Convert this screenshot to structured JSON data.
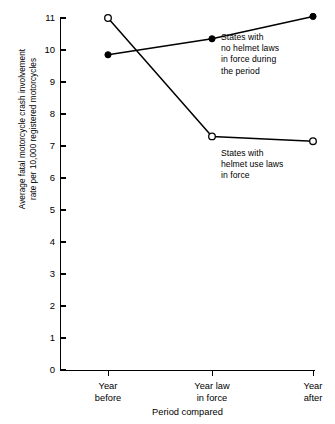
{
  "chart_data": {
    "type": "line",
    "title": "",
    "xlabel": "Period compared",
    "ylabel": "Average fatal motorcycle crash involvement\nrate per 10,000 registered motorcycles",
    "categories": [
      "Year\nbefore",
      "Year law\nin force",
      "Year\nafter"
    ],
    "ylim": [
      0,
      11
    ],
    "yticks": [
      0,
      1,
      2,
      3,
      4,
      5,
      6,
      7,
      8,
      9,
      10,
      11
    ],
    "grid": false,
    "legend_position": "inline-annotations",
    "series": [
      {
        "name": "States with\nno helmet laws\nin force during\nthe period",
        "marker": "filled-circle",
        "values": [
          9.85,
          10.35,
          11.05
        ]
      },
      {
        "name": "States with\nhelmet use laws\nin force",
        "marker": "open-circle",
        "values": [
          11.0,
          7.3,
          7.15
        ]
      }
    ],
    "line_color": "#000000",
    "marker_fill_series1": "#000000",
    "marker_fill_series2": "#ffffff"
  },
  "axes": {
    "y_tick_labels": [
      "11",
      "10",
      "9",
      "8",
      "7",
      "6",
      "5",
      "4",
      "3",
      "2",
      "1",
      "0"
    ],
    "y_title": "Average fatal motorcycle crash involvement\nrate per 10,000 registered motorcycles",
    "x_tick_labels": [
      "Year\nbefore",
      "Year law\nin force",
      "Year\nafter"
    ],
    "x_title": "Period compared"
  },
  "annotations": {
    "no_helmet": "States with\nno helmet laws\nin force during\nthe period",
    "helmet_use": "States with\nhelmet use laws\nin force"
  }
}
